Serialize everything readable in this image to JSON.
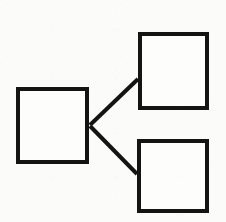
{
  "diagram": {
    "type": "node-link",
    "style": {
      "background_color": "#fbfbfa",
      "stroke_color": "#141414",
      "node_fill_color": "#fdfdfc",
      "stroke_width": 4
    },
    "canvas": {
      "width": 226,
      "height": 222
    },
    "nodes": [
      {
        "id": "node-left",
        "name": "left-block",
        "label": "",
        "shape": "rectangle",
        "x": 16,
        "y": 87,
        "width": 73,
        "height": 77
      },
      {
        "id": "node-top-right",
        "name": "top-right-block",
        "label": "",
        "shape": "rectangle",
        "x": 138,
        "y": 32,
        "width": 71,
        "height": 78
      },
      {
        "id": "node-bottom-right",
        "name": "bottom-right-block",
        "label": "",
        "shape": "rectangle",
        "x": 137,
        "y": 139,
        "width": 72,
        "height": 74
      }
    ],
    "edges": [
      {
        "id": "edge-left-to-top-right",
        "name": "connector-left-to-top-right",
        "from": "node-left",
        "to": "node-top-right",
        "label": "",
        "arrowhead": "none",
        "x1": 90,
        "y1": 125,
        "x2": 138,
        "y2": 79
      },
      {
        "id": "edge-left-to-bottom-right",
        "name": "connector-left-to-bottom-right",
        "from": "node-left",
        "to": "node-bottom-right",
        "label": "",
        "arrowhead": "none",
        "x1": 90,
        "y1": 126,
        "x2": 137,
        "y2": 174
      }
    ]
  }
}
